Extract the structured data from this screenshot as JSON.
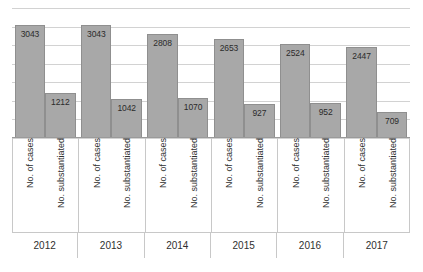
{
  "chart_data": {
    "type": "bar",
    "title": "",
    "subtitle": "",
    "xlabel": "",
    "ylabel": "",
    "categories": [
      "2012",
      "2013",
      "2014",
      "2015",
      "2016",
      "2017"
    ],
    "series": [
      {
        "name": "No. of cases",
        "values": [
          3043,
          3043,
          2808,
          2653,
          2524,
          2447
        ]
      },
      {
        "name": "No. substantiated",
        "values": [
          1212,
          1042,
          1070,
          927,
          952,
          709
        ]
      }
    ],
    "ylim": [
      0,
      3500
    ],
    "y_gridline_values": [
      3500,
      3000,
      2500,
      2000,
      1500,
      1000,
      500,
      0
    ],
    "grid": true,
    "legend": "none",
    "data_labels": true,
    "bar_color": "#a8a8a8",
    "bar_border_color": "#8f8f8f",
    "gridline_color": "#d2d2d2",
    "axis_color": "#9a9a9a",
    "background_color": "#ffffff",
    "groups": [
      {
        "year": "2012",
        "bars": [
          {
            "label": "No. of cases",
            "value": 3043,
            "value_text": "3043"
          },
          {
            "label": "No. substantiated",
            "value": 1212,
            "value_text": "1212"
          }
        ]
      },
      {
        "year": "2013",
        "bars": [
          {
            "label": "No. of cases",
            "value": 3043,
            "value_text": "3043"
          },
          {
            "label": "No. substantiated",
            "value": 1042,
            "value_text": "1042"
          }
        ]
      },
      {
        "year": "2014",
        "bars": [
          {
            "label": "No. of cases",
            "value": 2808,
            "value_text": "2808"
          },
          {
            "label": "No. substantiated",
            "value": 1070,
            "value_text": "1070"
          }
        ]
      },
      {
        "year": "2015",
        "bars": [
          {
            "label": "No. of cases",
            "value": 2653,
            "value_text": "2653"
          },
          {
            "label": "No. substantiated",
            "value": 927,
            "value_text": "927"
          }
        ]
      },
      {
        "year": "2016",
        "bars": [
          {
            "label": "No. of cases",
            "value": 2524,
            "value_text": "2524"
          },
          {
            "label": "No. substantiated",
            "value": 952,
            "value_text": "952"
          }
        ]
      },
      {
        "year": "2017",
        "bars": [
          {
            "label": "No. of cases",
            "value": 2447,
            "value_text": "2447"
          },
          {
            "label": "No. substantiated",
            "value": 709,
            "value_text": "709"
          }
        ]
      }
    ]
  }
}
